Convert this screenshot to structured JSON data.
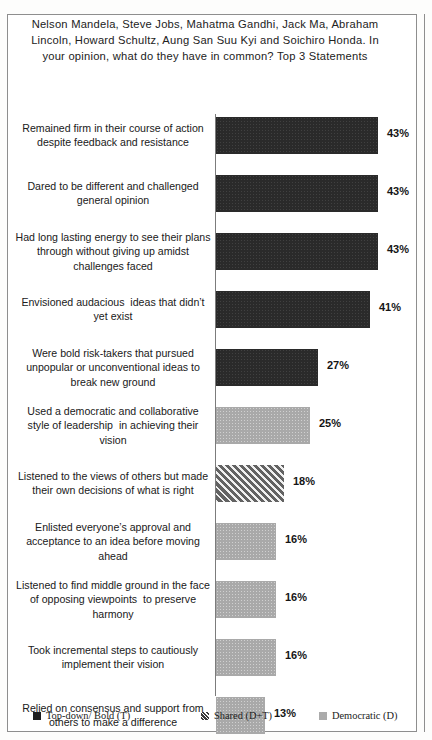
{
  "chart_data": {
    "type": "bar",
    "orientation": "horizontal",
    "title": "Nelson Mandela, Steve Jobs, Mahatma Gandhi, Jack Ma, Abraham Lincoln, Howard Schultz, Aung San Suu Kyi and Soichiro Honda. In your opinion, what do they have in common? Top 3 Statements",
    "xlabel": "",
    "ylabel": "",
    "xlim": [
      0,
      43
    ],
    "grid": false,
    "legend_position": "bottom",
    "categories": [
      "Remained firm in their course of action despite feedback and resistance",
      "Dared to be different and challenged general opinion",
      "Had long lasting energy to see their plans through without giving up amidst challenges faced",
      "Envisioned audacious  ideas that didn’t yet exist",
      "Were bold risk-takers that pursued unpopular or unconventional ideas to break new ground",
      "Used a democratic and collaborative style of leadership  in achieving their vision",
      "Listened to the views of others but made their own decisions of what is right",
      "Enlisted everyone’s approval and acceptance to an idea before moving ahead",
      "Listened to find middle ground in the face of opposing viewpoints  to preserve harmony",
      "Took incremental steps to cautiously implement their vision",
      "Relied on consensus and support from others to make a difference"
    ],
    "values": [
      43,
      43,
      43,
      41,
      27,
      25,
      18,
      16,
      16,
      16,
      13
    ],
    "value_labels": [
      "43%",
      "43%",
      "43%",
      "41%",
      "27%",
      "25%",
      "18%",
      "16%",
      "16%",
      "16%",
      "13%"
    ],
    "series_of_point": [
      "topdown",
      "topdown",
      "topdown",
      "topdown",
      "topdown",
      "democratic",
      "shared",
      "democratic",
      "democratic",
      "democratic",
      "democratic"
    ],
    "legend": [
      {
        "key": "topdown",
        "label": "Top-down/ Bold (T)",
        "color": "#1e1e1e"
      },
      {
        "key": "shared",
        "label": "Shared (D+T)",
        "color": "#9e9e9e"
      },
      {
        "key": "democratic",
        "label": "Democratic (D)",
        "color": "#ababab"
      }
    ]
  }
}
